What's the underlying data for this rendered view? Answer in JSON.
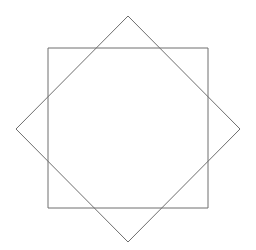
{
  "figure": {
    "name": "octagram-two-squares",
    "canvas": {
      "width": 256,
      "height": 250,
      "background_color": "#ffffff"
    },
    "style": {
      "stroke_color": "#6e6e6e",
      "stroke_width": 1,
      "fill": "none"
    },
    "shapes": [
      {
        "name": "axis-aligned-square",
        "type": "square",
        "rotation_degrees": 0,
        "center": [
          128,
          128
        ],
        "side_length": 160,
        "points": "48,48 208,48 208,208 48,208",
        "vertices": [
          [
            48,
            48
          ],
          [
            208,
            48
          ],
          [
            208,
            208
          ],
          [
            48,
            208
          ]
        ]
      },
      {
        "name": "rotated-square-diamond",
        "type": "square",
        "rotation_degrees": 45,
        "center": [
          128,
          129
        ],
        "circumradius": 113,
        "points": "128,16 240,129 128,242 16,129",
        "vertices": [
          [
            128,
            16
          ],
          [
            240,
            129
          ],
          [
            128,
            242
          ],
          [
            16,
            129
          ]
        ]
      }
    ]
  }
}
